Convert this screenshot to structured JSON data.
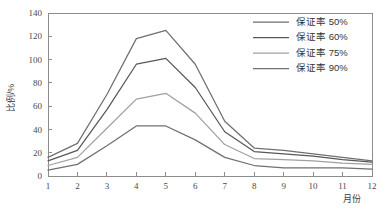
{
  "chart_data": {
    "type": "line",
    "title": "",
    "xlabel": "月份",
    "ylabel": "比例/%",
    "x": [
      1,
      2,
      3,
      4,
      5,
      6,
      7,
      8,
      9,
      10,
      11,
      12
    ],
    "xticklabels": [
      "1",
      "2",
      "3",
      "4",
      "5",
      "6",
      "7",
      "8",
      "9",
      "10",
      "11",
      "12"
    ],
    "yticklabels": [
      "0",
      "20",
      "40",
      "60",
      "80",
      "100",
      "120",
      "140"
    ],
    "yticks": [
      0,
      20,
      40,
      60,
      80,
      100,
      120,
      140
    ],
    "xlim": [
      1,
      12
    ],
    "ylim": [
      0,
      140
    ],
    "grid": false,
    "legend_position": "top-right",
    "series": [
      {
        "name": "保证率 50%",
        "color": "#6f6f6f",
        "values": [
          16,
          28,
          70,
          118,
          125,
          96,
          47,
          24,
          22,
          19,
          16,
          13
        ]
      },
      {
        "name": "保证率 60%",
        "color": "#585858",
        "values": [
          13,
          22,
          57,
          96,
          101,
          76,
          38,
          21,
          19,
          17,
          14,
          12
        ]
      },
      {
        "name": "保证率 75%",
        "color": "#a0a0a0",
        "values": [
          9,
          16,
          41,
          66,
          71,
          54,
          27,
          15,
          14,
          13,
          11,
          10
        ]
      },
      {
        "name": "保证率 90%",
        "color": "#707070",
        "values": [
          5,
          10,
          26,
          43,
          43,
          31,
          16,
          9,
          7,
          7,
          7,
          6
        ]
      }
    ]
  },
  "axes": {
    "y_axis_title": "比例/%",
    "x_axis_title": "月份"
  },
  "legend": {
    "entries": [
      {
        "label": "保证率 50%",
        "color": "#6f6f6f"
      },
      {
        "label": "保证率 60%",
        "color": "#585858"
      },
      {
        "label": "保证率 75%",
        "color": "#a0a0a0"
      },
      {
        "label": "保证率 90%",
        "color": "#707070"
      }
    ]
  },
  "colors": {
    "axis": "#8d8d8d",
    "text": "#3a3a3a",
    "background": "#ffffff"
  }
}
